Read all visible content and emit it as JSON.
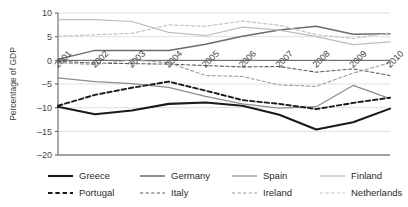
{
  "chart_data": {
    "type": "line",
    "title": "",
    "xlabel": "",
    "ylabel": "Percentage of GDP",
    "ylim": [
      -20,
      10
    ],
    "yticks": [
      10,
      5,
      0,
      -5,
      -10,
      -15,
      -20
    ],
    "ytick_labels": [
      "10",
      "5",
      "0",
      "–5",
      "–10",
      "–15",
      "–20"
    ],
    "x": [
      2001,
      2002,
      2003,
      2004,
      2005,
      2006,
      2007,
      2008,
      2009,
      2010
    ],
    "xtick_labels": [
      "2001",
      "2002",
      "2003",
      "2004",
      "2005",
      "2006",
      "2007",
      "2008",
      "2009",
      "2010"
    ],
    "grid": true,
    "legend_position": "bottom",
    "series": [
      {
        "name": "Greece",
        "style": "solid",
        "color": "#1a1a1a",
        "width": 2.1,
        "values": [
          -9.8,
          -11.4,
          -10.6,
          -9.2,
          -8.9,
          -9.6,
          -11.5,
          -14.6,
          -13.1,
          -10.2
        ]
      },
      {
        "name": "Germany",
        "style": "solid",
        "color": "#6b6b6b",
        "width": 1.5,
        "values": [
          0.2,
          2.1,
          2.1,
          2.1,
          3.4,
          5.1,
          6.4,
          7.2,
          5.5,
          5.6
        ]
      },
      {
        "name": "Spain",
        "style": "solid",
        "color": "#8c8c8c",
        "width": 1.2,
        "values": [
          -3.7,
          -4.5,
          -4.9,
          -5.7,
          -7.6,
          -9.2,
          -10.1,
          -9.8,
          -5.3,
          -8.1
        ]
      },
      {
        "name": "Finland",
        "style": "solid",
        "color": "#bdbdbd",
        "width": 1.2,
        "values": [
          8.6,
          8.6,
          8.2,
          5.9,
          5.2,
          7.0,
          6.4,
          5.0,
          3.3,
          3.9
        ]
      },
      {
        "name": "Portugal",
        "style": "dashed",
        "color": "#1a1a1a",
        "width": 1.9,
        "values": [
          -9.6,
          -7.3,
          -5.8,
          -4.5,
          -6.4,
          -8.4,
          -9.2,
          -10.3,
          -9.0,
          -7.9
        ]
      },
      {
        "name": "Italy",
        "style": "dashed",
        "color": "#5c5c5c",
        "width": 1.1,
        "values": [
          -0.2,
          -0.6,
          -0.7,
          -0.8,
          -1.1,
          -1.4,
          -1.3,
          -2.5,
          -1.8,
          -3.2
        ]
      },
      {
        "name": "Ireland",
        "style": "dashed",
        "color": "#9c9c9c",
        "width": 1.1,
        "values": [
          -0.5,
          -0.9,
          0.1,
          -0.5,
          -3.2,
          -3.4,
          -5.2,
          -5.5,
          -2.7,
          -0.5
        ]
      },
      {
        "name": "Netherlands",
        "style": "dashed",
        "color": "#c4c4c4",
        "width": 1.2,
        "values": [
          5.1,
          5.4,
          5.7,
          7.5,
          7.2,
          8.3,
          7.4,
          5.4,
          4.6,
          5.8
        ]
      }
    ]
  },
  "legend": {
    "items": [
      {
        "label": "Greece"
      },
      {
        "label": "Germany"
      },
      {
        "label": "Spain"
      },
      {
        "label": "Finland"
      },
      {
        "label": "Portugal"
      },
      {
        "label": "Italy"
      },
      {
        "label": "Ireland"
      },
      {
        "label": "Netherlands"
      }
    ]
  }
}
